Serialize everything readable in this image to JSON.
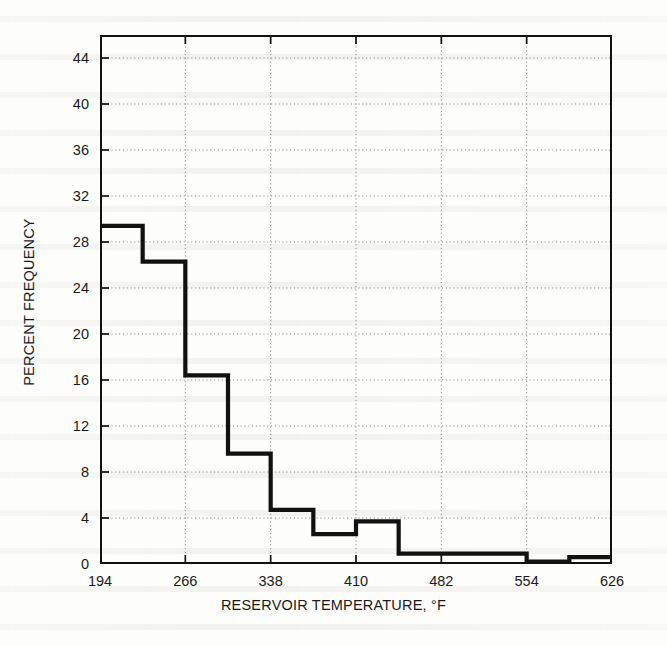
{
  "chart_data": {
    "type": "bar",
    "subtype": "step-histogram",
    "title": "",
    "xlabel": "RESERVOIR TEMPERATURE, °F",
    "ylabel": "PERCENT FREQUENCY",
    "xlim": [
      194,
      626
    ],
    "ylim": [
      0,
      46
    ],
    "xticks": [
      194,
      266,
      338,
      410,
      482,
      554,
      626
    ],
    "xtick_labels": [
      "194",
      "266",
      "338",
      "410",
      "482",
      "554",
      "626"
    ],
    "yticks": [
      0,
      4,
      8,
      12,
      16,
      20,
      24,
      28,
      32,
      36,
      40,
      44
    ],
    "ytick_labels": [
      "0",
      "4",
      "8",
      "12",
      "16",
      "20",
      "24",
      "28",
      "32",
      "36",
      "40",
      "44"
    ],
    "grid": true,
    "grid_style": "dotted",
    "legend": null,
    "bin_width": 36,
    "bin_edges": [
      194,
      230,
      266,
      302,
      338,
      374,
      410,
      446,
      482,
      518,
      554,
      590,
      626
    ],
    "categories": [
      "194-230",
      "230-266",
      "266-302",
      "302-338",
      "338-374",
      "374-410",
      "410-446",
      "446-482",
      "482-518",
      "518-554",
      "554-590",
      "590-626"
    ],
    "values": [
      29.4,
      26.3,
      16.4,
      9.6,
      4.7,
      2.6,
      3.7,
      0.9,
      0.9,
      0.9,
      0.2,
      0.6
    ],
    "series": [
      {
        "name": "Percent frequency",
        "values": [
          29.4,
          26.3,
          16.4,
          9.6,
          4.7,
          2.6,
          3.7,
          0.9,
          0.9,
          0.9,
          0.2,
          0.6
        ]
      }
    ],
    "line_color": "#111111",
    "grid_color": "#8d8d8d",
    "axis_color": "#111111",
    "background": "#fdfdfb"
  }
}
